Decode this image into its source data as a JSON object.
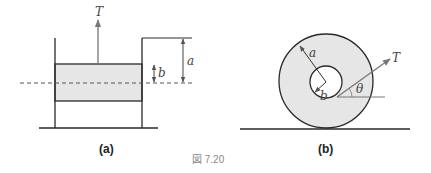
{
  "figure": {
    "caption": "図 7.20",
    "panel_a": {
      "label": "(a)",
      "tension_label": "T",
      "dim_outer_label": "a",
      "dim_inner_label": "b"
    },
    "panel_b": {
      "label": "(b)",
      "tension_label": "T",
      "outer_radius_label": "a",
      "inner_radius_label": "b",
      "angle_label": "θ"
    },
    "colors": {
      "line": "#2a2a2a",
      "fill": "#e6e6e6",
      "arrow": "#777777"
    }
  }
}
